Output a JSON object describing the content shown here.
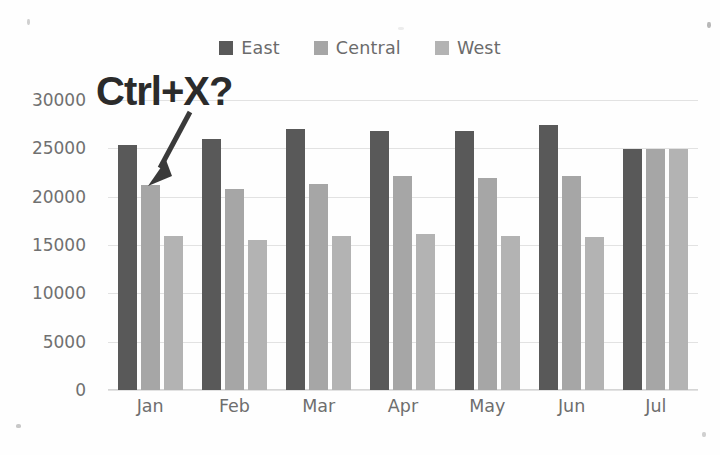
{
  "chart_data": {
    "type": "bar",
    "title": "",
    "xlabel": "",
    "ylabel": "",
    "categories": [
      "Jan",
      "Feb",
      "Mar",
      "Apr",
      "May",
      "Jun",
      "Jul"
    ],
    "series": [
      {
        "name": "East",
        "color": "#595959",
        "values": [
          25300,
          26000,
          27000,
          26800,
          26800,
          27400,
          24900
        ]
      },
      {
        "name": "Central",
        "color": "#a6a6a6",
        "values": [
          21200,
          20800,
          21300,
          22100,
          21900,
          22100,
          24900
        ]
      },
      {
        "name": "West",
        "color": "#b3b3b3",
        "values": [
          15900,
          15500,
          15900,
          16100,
          15900,
          15800,
          24900
        ]
      }
    ],
    "ylim": [
      0,
      30000
    ],
    "ytick_values": [
      30000,
      25000,
      20000,
      15000,
      10000,
      5000,
      0
    ],
    "ytick_labels": [
      "30000",
      "25000",
      "20000",
      "15000",
      "10000",
      "5000",
      "0"
    ],
    "grid": true,
    "legend_position": "top",
    "annotations": [
      {
        "text": "Ctrl+X?",
        "kind": "text-with-arrow",
        "color": "#2b2b2b",
        "points_to": "Jan Central bar"
      }
    ]
  },
  "legend": {
    "items": [
      {
        "label": "East",
        "swatch_color": "#595959"
      },
      {
        "label": "Central",
        "swatch_color": "#a6a6a6"
      },
      {
        "label": "West",
        "swatch_color": "#b3b3b3"
      }
    ]
  },
  "annotation": {
    "label": "Ctrl+X?"
  },
  "colors": {
    "background": "#fefefe",
    "gridline": "#e2e2e2",
    "tick_text": "#707070",
    "annotation": "#2b2b2b"
  }
}
